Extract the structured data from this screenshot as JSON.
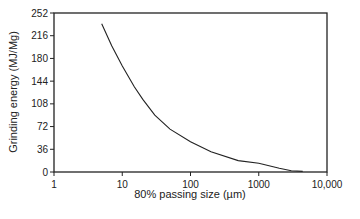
{
  "chart_data": {
    "type": "line",
    "title": "",
    "xlabel": "80% passing size (µm)",
    "ylabel": "Grinding energy (MJ/Mg)",
    "xscale": "log",
    "xlim": [
      1,
      10000
    ],
    "ylim": [
      0,
      252
    ],
    "x_ticks": [
      "1",
      "10",
      "100",
      "1000",
      "10,000"
    ],
    "y_ticks": [
      "0",
      "36",
      "72",
      "108",
      "144",
      "180",
      "216",
      "252"
    ],
    "grid": false,
    "legend": null,
    "series": [
      {
        "name": "Grinding energy",
        "x": [
          5,
          7,
          10,
          15,
          20,
          30,
          50,
          100,
          200,
          500,
          1000,
          2000,
          3000,
          4400
        ],
        "y": [
          235,
          200,
          168,
          135,
          115,
          90,
          68,
          48,
          32,
          18,
          14,
          6,
          2,
          1
        ]
      }
    ]
  }
}
